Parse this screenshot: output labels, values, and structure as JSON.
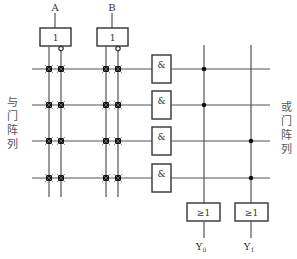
{
  "diagram": {
    "type": "PLA (programmable logic array) structure",
    "inputs": [
      {
        "label": "A",
        "buffer_label": "1"
      },
      {
        "label": "B",
        "buffer_label": "1"
      }
    ],
    "and_array": {
      "label": "与门阵列",
      "label_chars": [
        "与",
        "门",
        "阵",
        "列"
      ],
      "gate_label": "&",
      "gate_count": 4
    },
    "or_array": {
      "label": "或门阵列",
      "label_chars": [
        "或",
        "门",
        "阵",
        "列"
      ],
      "gate_label": "≥1",
      "gate_count": 2
    },
    "outputs": [
      {
        "label": "Y",
        "subscript": "0"
      },
      {
        "label": "Y",
        "subscript": "1"
      }
    ],
    "or_connections": {
      "Y0": [
        1,
        2
      ],
      "Y1": [
        3,
        4
      ]
    },
    "colors": {
      "line": "#555555",
      "fuse": "#111111",
      "background": "#ffffff"
    }
  }
}
